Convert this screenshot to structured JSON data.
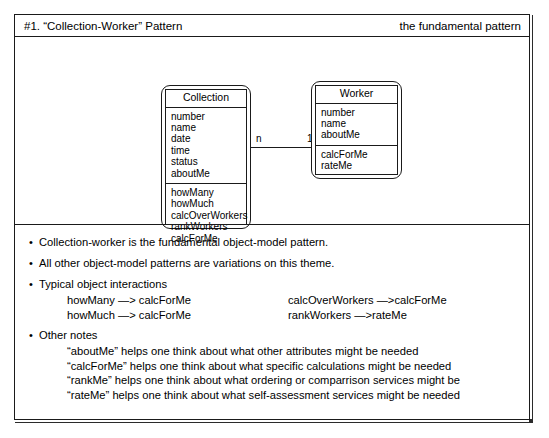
{
  "header": {
    "title_left": "#1. “Collection-Worker” Pattern",
    "title_right": "the fundamental pattern"
  },
  "diagram": {
    "classes": [
      {
        "name": "Collection",
        "attributes": [
          "number",
          "name",
          "date",
          "time",
          "status",
          "aboutMe"
        ],
        "operations": [
          "howMany",
          "howMuch",
          "calcOverWorkers",
          "rankWorkers",
          "calcForMe"
        ]
      },
      {
        "name": "Worker",
        "attributes": [
          "number",
          "name",
          "aboutMe"
        ],
        "operations": [
          "calcForMe",
          "rateMe"
        ]
      }
    ],
    "association": {
      "source_multiplicity": "n",
      "target_multiplicity": "1"
    }
  },
  "notes": {
    "bullets": [
      "Collection-worker is the fundamental object-model pattern.",
      "All other object-model patterns are variations on this theme.",
      "Typical object interactions",
      "Other notes"
    ],
    "bullet_char": "•",
    "interactions": [
      {
        "left": "howMany —> calcForMe",
        "right": "calcOverWorkers —>calcForMe"
      },
      {
        "left": "howMuch —> calcForMe",
        "right": "rankWorkers —>rateMe"
      }
    ],
    "other_notes": [
      "“aboutMe” helps one think about what other attributes might be needed",
      "“calcForMe” helps one think about what specific calculations might be needed",
      "“rankMe” helps one think about what ordering or comparrison services might be",
      "“rateMe” helps one think about what self-assessment services might be needed"
    ]
  }
}
